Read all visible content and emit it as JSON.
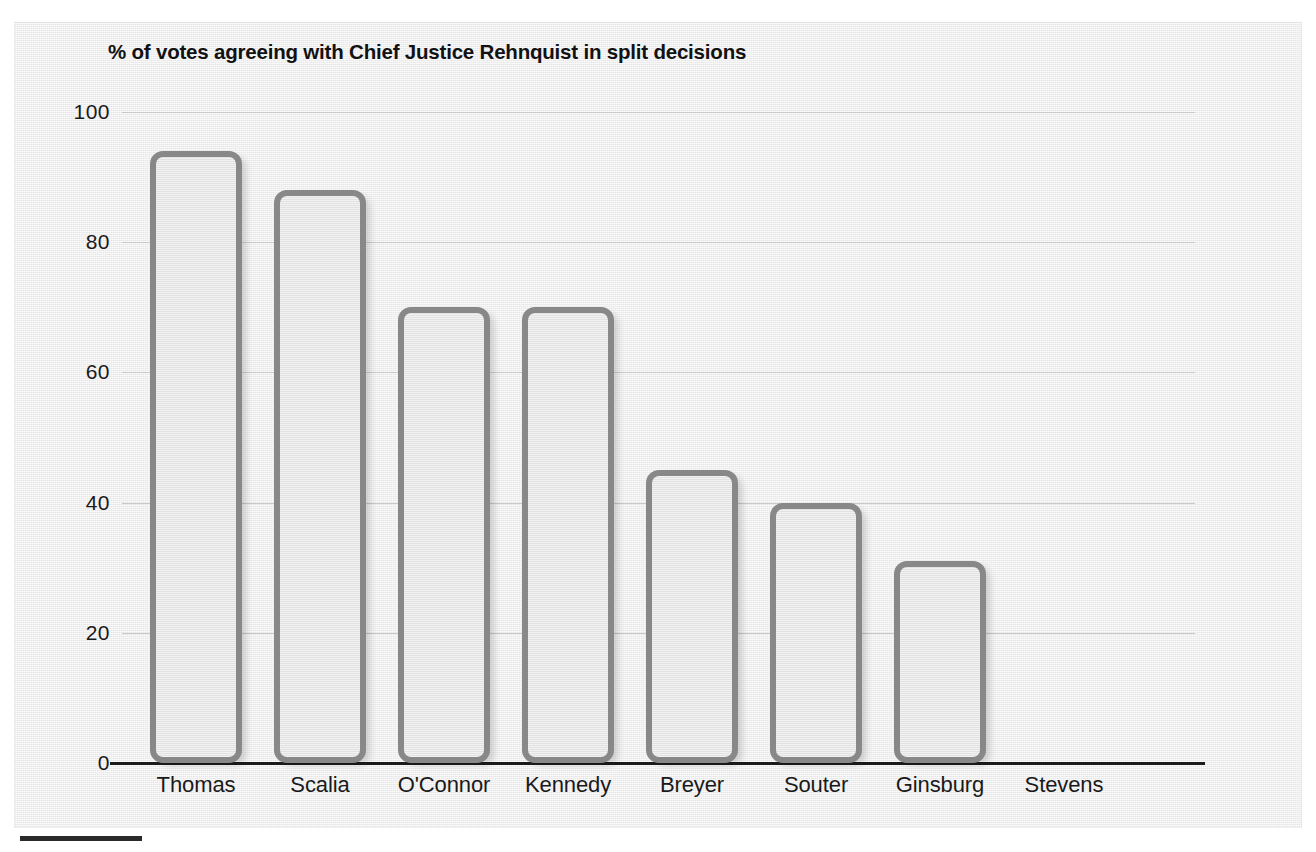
{
  "chart_data": {
    "type": "bar",
    "title": "% of votes agreeing with Chief Justice Rehnquist in split decisions",
    "xlabel": "",
    "ylabel": "",
    "categories": [
      "Thomas",
      "Scalia",
      "O'Connor",
      "Kennedy",
      "Breyer",
      "Souter",
      "Ginsburg",
      "Stevens"
    ],
    "values": [
      94,
      88,
      70,
      70,
      45,
      40,
      31,
      null
    ],
    "ylim": [
      0,
      100
    ],
    "yticks": [
      0,
      20,
      40,
      60,
      80,
      100
    ],
    "ytick_labels": [
      "0",
      "20",
      "40",
      "60",
      "80",
      "100"
    ],
    "grid": true,
    "legend": false
  },
  "colors": {
    "panel_background": "#ececec",
    "bar_fill": "#e6e6e6",
    "bar_border": "#888888",
    "gridline": "#c9c9c9",
    "axis_line": "#1b1b1b",
    "text": "#1a1a1a",
    "title_text": "#121212"
  }
}
